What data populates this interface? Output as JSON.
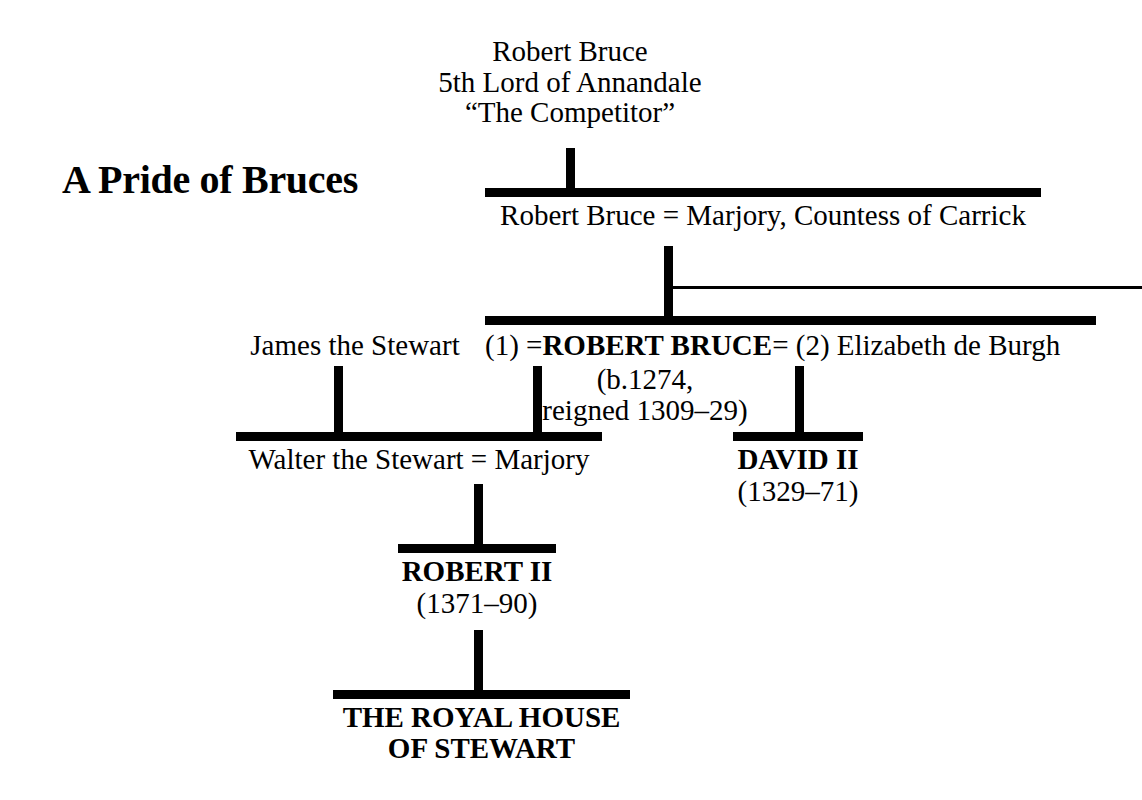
{
  "title": "A Pride of Bruces",
  "diagram": {
    "type": "family-tree",
    "generations": [
      {
        "id": "gen1",
        "nodes": [
          {
            "id": "robert-bruce-competitor",
            "lines": [
              "Robert Bruce",
              "5th Lord of Annandale",
              "“The Competitor”"
            ],
            "style": "regular"
          }
        ]
      },
      {
        "id": "gen2",
        "nodes": [
          {
            "id": "robert-bruce-marjory",
            "lines": [
              "Robert Bruce = Marjory, Countess of Carrick"
            ],
            "style": "regular"
          }
        ]
      },
      {
        "id": "gen3",
        "nodes": [
          {
            "id": "james-the-stewart",
            "lines": [
              "James the Stewart"
            ],
            "style": "regular"
          },
          {
            "id": "robert-bruce-king",
            "marriage_one_label": "(1) =",
            "name": "ROBERT BRUCE",
            "marriage_two_label": "= (2) Elizabeth de Burgh",
            "detail_line_1": "(b.1274,",
            "detail_line_2": "reigned 1309–29)",
            "style": "bold"
          }
        ]
      },
      {
        "id": "gen4",
        "nodes": [
          {
            "id": "walter-the-stewart-marjory",
            "lines": [
              "Walter the Stewart = Marjory"
            ],
            "style": "regular"
          },
          {
            "id": "david-ii",
            "name": "DAVID II",
            "dates": "(1329–71)",
            "style": "bold"
          }
        ]
      },
      {
        "id": "gen5",
        "nodes": [
          {
            "id": "robert-ii",
            "name": "ROBERT II",
            "dates": "(1371–90)",
            "style": "bold"
          }
        ]
      },
      {
        "id": "gen6",
        "nodes": [
          {
            "id": "royal-house-of-stewart",
            "line_1": "THE ROYAL HOUSE",
            "line_2": "OF STEWART",
            "style": "bold"
          }
        ]
      }
    ],
    "colors": {
      "ink": "#000000",
      "paper": "#ffffff"
    }
  },
  "labels": {
    "competitor_line_1": "Robert Bruce",
    "competitor_line_2": "5th Lord of Annandale",
    "competitor_line_3": "“The Competitor”",
    "gen2_couple": "Robert Bruce = Marjory, Countess of Carrick",
    "james_the_stewart": "James the Stewart",
    "marriage_1": "(1) =",
    "robert_bruce_king": "ROBERT BRUCE",
    "marriage_2": "= (2) Elizabeth de Burgh",
    "robert_bruce_born": "(b.1274,",
    "robert_bruce_reigned": "reigned 1309–29)",
    "walter_couple": "Walter the Stewart = Marjory",
    "david_ii": "DAVID II",
    "david_ii_dates": "(1329–71)",
    "robert_ii": "ROBERT II",
    "robert_ii_dates": "(1371–90)",
    "royal_house_1": "THE ROYAL HOUSE",
    "royal_house_2": "OF STEWART"
  }
}
